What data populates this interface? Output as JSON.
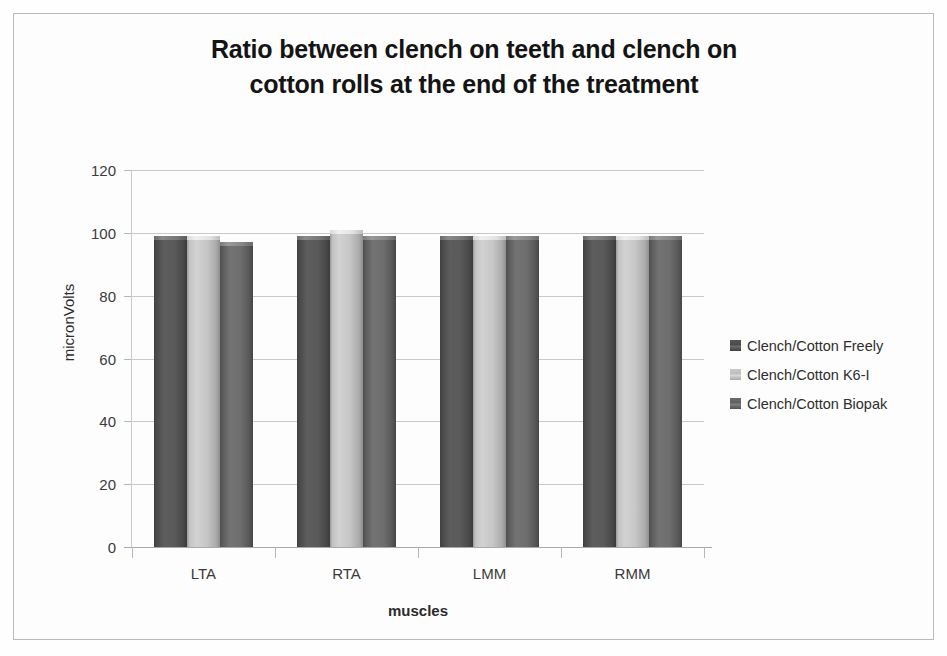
{
  "chart_data": {
    "type": "bar",
    "title": "Ratio between clench on teeth and clench on cotton rolls at the end of the treatment",
    "title_lines": [
      "Ratio between clench on teeth and clench on",
      "cotton rolls at the end of the treatment"
    ],
    "xlabel": "muscles",
    "ylabel": "micronVolts",
    "categories": [
      "LTA",
      "RTA",
      "LMM",
      "RMM"
    ],
    "ylim": [
      0,
      120
    ],
    "yticks": [
      120,
      100,
      80,
      60,
      40,
      20,
      0
    ],
    "grid": true,
    "legend_position": "right",
    "series": [
      {
        "name": "Clench/Cotton Freely",
        "color": "#555555",
        "values": [
          99,
          99,
          99,
          99
        ]
      },
      {
        "name": "Clench/Cotton K6-I",
        "color": "#c6c6c6",
        "values": [
          99,
          101,
          99,
          99
        ]
      },
      {
        "name": "Clench/Cotton Biopak",
        "color": "#6e6e6e",
        "values": [
          97,
          99,
          99,
          99
        ]
      }
    ]
  }
}
